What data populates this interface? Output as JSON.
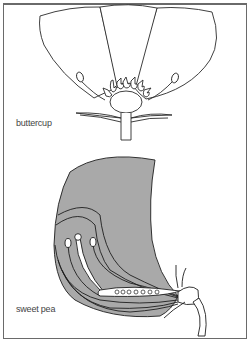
{
  "figure": {
    "labels": {
      "buttercup": "buttercup",
      "sweet_pea": "sweet pea"
    },
    "colors": {
      "outline": "#2a2a2a",
      "petal_fill": "#ffffff",
      "pea_fill": "#a9a9a9",
      "background": "#ffffff",
      "frame": "#6a6a6a"
    }
  }
}
